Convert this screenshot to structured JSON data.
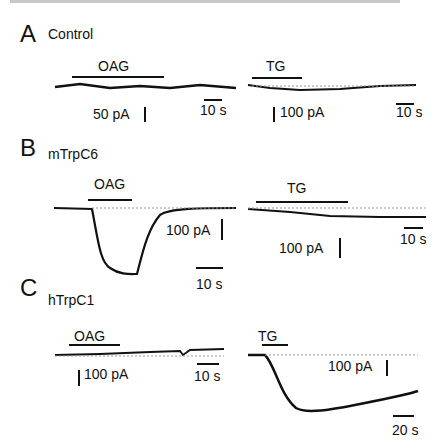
{
  "figure": {
    "panels": [
      {
        "letter": "A",
        "condition": "Control",
        "left": {
          "drug": "OAG",
          "scale_current": "50 pA",
          "scale_time": "10 s"
        },
        "right": {
          "drug": "TG",
          "scale_current": "100 pA",
          "scale_time": "10 s"
        }
      },
      {
        "letter": "B",
        "condition": "mTrpC6",
        "left": {
          "drug": "OAG",
          "scale_current": "100 pA",
          "scale_time": "10 s"
        },
        "right": {
          "drug": "TG",
          "scale_current": "100 pA",
          "scale_time": "10 s"
        }
      },
      {
        "letter": "C",
        "condition": "hTrpC1",
        "left": {
          "drug": "OAG",
          "scale_current": "100 pA",
          "scale_time": "10 s"
        },
        "right": {
          "drug": "TG",
          "scale_current": "100 pA",
          "scale_time": "20 s"
        }
      }
    ]
  },
  "colors": {
    "trace": "#111111",
    "baseline": "#999999"
  }
}
